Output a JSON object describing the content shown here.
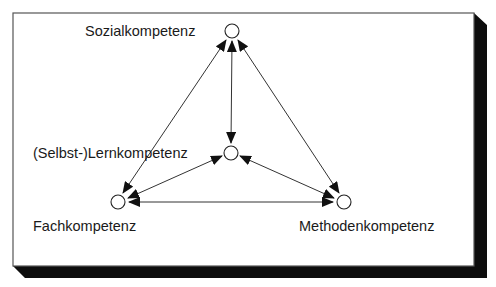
{
  "figure": {
    "frame": {
      "border_color": "#555555",
      "shadow_color": "#0d0d0d",
      "background": "#ffffff"
    },
    "nodes": [
      {
        "id": "sozial",
        "label": "Sozialkompetenz",
        "cx": 232,
        "cy": 31
      },
      {
        "id": "lern",
        "label": "(Selbst-)Lernkompetenz",
        "cx": 231,
        "cy": 153
      },
      {
        "id": "fach",
        "label": "Fachkompetenz",
        "cx": 118,
        "cy": 202
      },
      {
        "id": "methoden",
        "label": "Methodenkompetenz",
        "cx": 344,
        "cy": 202
      }
    ],
    "edges": [
      {
        "from": "sozial",
        "to": "lern",
        "bidirectional": true
      },
      {
        "from": "sozial",
        "to": "fach",
        "bidirectional": true
      },
      {
        "from": "sozial",
        "to": "methoden",
        "bidirectional": true
      },
      {
        "from": "lern",
        "to": "fach",
        "bidirectional": true
      },
      {
        "from": "lern",
        "to": "methoden",
        "bidirectional": true
      },
      {
        "from": "fach",
        "to": "methoden",
        "bidirectional": true
      }
    ]
  }
}
